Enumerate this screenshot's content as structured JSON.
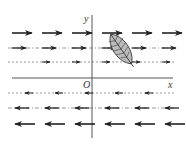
{
  "diagram": {
    "axes": {
      "x_label": "x",
      "y_label": "y",
      "origin_label": "O"
    },
    "colors": {
      "ink": "#222222",
      "axis": "#444444",
      "leaf_fill": "#bbbbbb",
      "background": "#ffffff"
    },
    "rows": [
      {
        "y": 33,
        "style": "solid",
        "direction": "right",
        "arrows": [
          12,
          42,
          72,
          102,
          132,
          162
        ]
      },
      {
        "y": 48,
        "style": "dash-dot",
        "direction": "right",
        "arrows": [
          12,
          42,
          72,
          102,
          132,
          162
        ]
      },
      {
        "y": 62,
        "style": "dashed",
        "direction": "right",
        "arrows": [
          42,
          72,
          102,
          132,
          162
        ]
      },
      {
        "y": 93,
        "style": "dashed",
        "direction": "left",
        "arrows": [
          25,
          55,
          85,
          115,
          145
        ]
      },
      {
        "y": 108,
        "style": "dash-dot",
        "direction": "left",
        "arrows": [
          15,
          45,
          75,
          105,
          135,
          165
        ]
      },
      {
        "y": 124,
        "style": "solid",
        "direction": "left",
        "arrows": [
          15,
          45,
          75,
          105,
          135,
          165
        ]
      }
    ],
    "leaf": {
      "cx": 121,
      "cy": 49,
      "label": "leaf"
    }
  }
}
